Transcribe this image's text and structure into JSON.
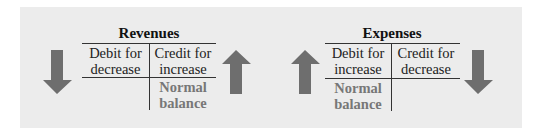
{
  "colors": {
    "panel": "#ececec",
    "arrow": "#6e6e6e",
    "normal_balance": "#777777"
  },
  "revenues": {
    "title": "Revenues",
    "debit": [
      "Debit for",
      "decrease"
    ],
    "credit": [
      "Credit for",
      "increase"
    ],
    "normal_balance": [
      "Normal",
      "balance"
    ],
    "normal_balance_side": "credit",
    "left_arrow": "arrow-down-icon",
    "right_arrow": "arrow-up-icon"
  },
  "expenses": {
    "title": "Expenses",
    "debit": [
      "Debit for",
      "increase"
    ],
    "credit": [
      "Credit for",
      "decrease"
    ],
    "normal_balance": [
      "Normal",
      "balance"
    ],
    "normal_balance_side": "debit",
    "left_arrow": "arrow-up-icon",
    "right_arrow": "arrow-down-icon"
  }
}
